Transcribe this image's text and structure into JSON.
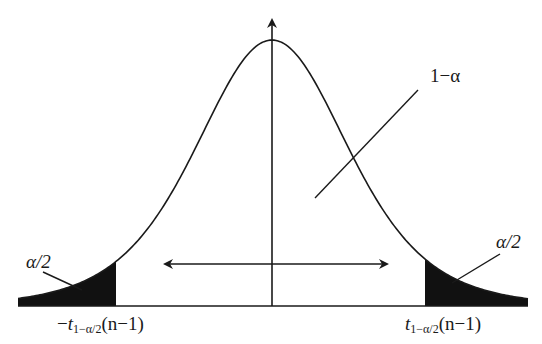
{
  "diagram": {
    "type": "t-distribution two-tailed critical region",
    "center_label": "1−α",
    "left_tail_label": "α/2",
    "right_tail_label": "α/2",
    "left_critical": {
      "sign": "−",
      "var": "t",
      "sub": "1−α/2",
      "arg": "(n−1)"
    },
    "right_critical": {
      "sign": "",
      "var": "t",
      "sub": "1−α/2",
      "arg": "(n−1)"
    },
    "colors": {
      "line": "#1a1a1a",
      "tail_fill": "#111111",
      "background": "#ffffff"
    }
  }
}
